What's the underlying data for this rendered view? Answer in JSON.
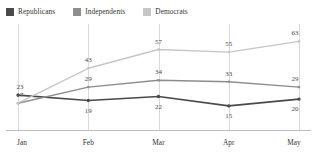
{
  "chart_data": {
    "type": "line",
    "title": "",
    "xlabel": "",
    "ylabel": "",
    "categories": [
      "Jan",
      "Feb",
      "Mar",
      "Apr",
      "May"
    ],
    "ylim": [
      0,
      70
    ],
    "grid": "vertical",
    "legend_position": "top-left",
    "series": [
      {
        "name": "Republicans",
        "color": "#4a4a4a",
        "values": [
          23,
          19,
          22,
          15,
          20
        ],
        "labels": [
          "23",
          "19",
          "22",
          "15",
          "20"
        ]
      },
      {
        "name": "Independents",
        "color": "#8d8d8d",
        "values": [
          17,
          29,
          34,
          33,
          29
        ],
        "labels": [
          "17",
          "29",
          "34",
          "33",
          "29"
        ]
      },
      {
        "name": "Democrats",
        "color": "#c6c6c6",
        "values": [
          17,
          43,
          57,
          55,
          63
        ],
        "labels": [
          "",
          "43",
          "57",
          "55",
          "63"
        ]
      }
    ]
  },
  "legend": {
    "items": [
      {
        "label": "Republicans",
        "color": "#4a4a4a"
      },
      {
        "label": "Independents",
        "color": "#8d8d8d"
      },
      {
        "label": "Democrats",
        "color": "#c6c6c6"
      }
    ]
  },
  "axis": {
    "ticks": [
      "Jan",
      "Feb",
      "Mar",
      "Apr",
      "May"
    ],
    "baseline_color": "#bdbdbd",
    "gridline_color": "#d9d9d9"
  }
}
